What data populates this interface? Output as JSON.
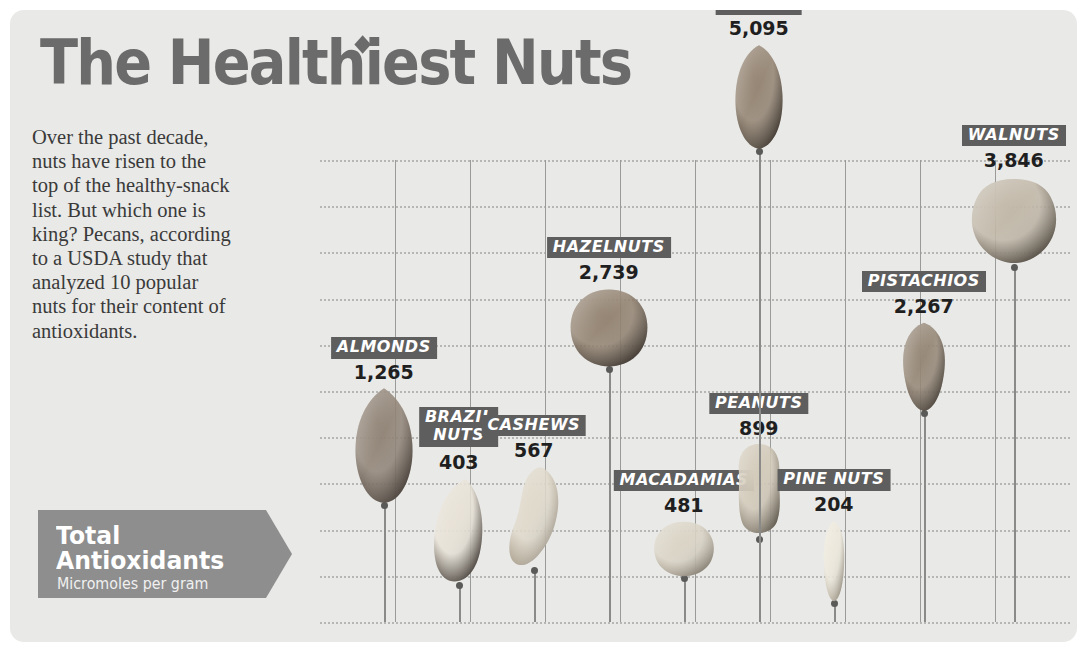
{
  "title": "The Healthiest Nuts",
  "intro": "Over the past decade, nuts have risen to the top of the healthy-snack list. But which one is king? Pecans, according to a USDA study that analyzed 10 popular nuts for their content of antioxidants.",
  "legend": {
    "line1": "Total",
    "line2": "Antioxidants",
    "sub": "Micromoles per gram"
  },
  "colors": {
    "card_bg": "#e9e9e7",
    "title": "#6b6b6b",
    "badge": "#5e5e5e",
    "banner": "#8e8e8e",
    "grid": "#b6b6b4"
  },
  "chart_data": {
    "type": "bar",
    "title": "The Healthiest Nuts",
    "xlabel": "",
    "ylabel": "Total Antioxidants (Micromoles per gram)",
    "ylim": [
      0,
      5000
    ],
    "grid": true,
    "legend": "none",
    "ytick_labels": [
      "5,000",
      "4,500",
      "4,000",
      "3,500",
      "3,000",
      "2,500",
      "2,000",
      "1,500",
      "1,000",
      "500",
      "0"
    ],
    "ytick_values": [
      5000,
      4500,
      4000,
      3500,
      3000,
      2500,
      2000,
      1500,
      1000,
      500,
      0
    ],
    "categories": [
      "ALMONDS",
      "BRAZIL NUTS",
      "CASHEWS",
      "HAZELNUTS",
      "MACADAMIAS",
      "PEANUTS",
      "PINE NUTS",
      "PISTACHIOS",
      "WALNUTS",
      "PECANS"
    ],
    "values": [
      1265,
      403,
      567,
      2739,
      481,
      899,
      204,
      2267,
      3846,
      5095
    ],
    "value_labels": [
      "1,265",
      "403",
      "567",
      "2,739",
      "481",
      "899",
      "204",
      "2,267",
      "3,846",
      "5,095"
    ],
    "points": [
      {
        "name": "ALMONDS",
        "label_lines": [
          "ALMONDS"
        ],
        "value": 1265,
        "value_label": "1,265",
        "x_frac": 0.085,
        "nut": {
          "w": 62,
          "h": 118,
          "shape": "almond",
          "c1": "#8a7c6e",
          "c2": "#4a4038"
        }
      },
      {
        "name": "BRAZIL NUTS",
        "label_lines": [
          "BRAZIL",
          "NUTS"
        ],
        "value": 403,
        "value_label": "403",
        "x_frac": 0.185,
        "nut": {
          "w": 58,
          "h": 108,
          "shape": "brazil",
          "c1": "#e6e0d4",
          "c2": "#3a322a"
        }
      },
      {
        "name": "CASHEWS",
        "label_lines": [
          "CASHEWS"
        ],
        "value": 567,
        "value_label": "567",
        "x_frac": 0.285,
        "nut": {
          "w": 60,
          "h": 105,
          "shape": "cashew",
          "c1": "#ded7c8",
          "c2": "#a79c89"
        }
      },
      {
        "name": "HAZELNUTS",
        "label_lines": [
          "HAZELNUTS"
        ],
        "value": 2739,
        "value_label": "2,739",
        "x_frac": 0.385,
        "nut": {
          "w": 80,
          "h": 82,
          "shape": "round",
          "c1": "#8c7b68",
          "c2": "#3d342b"
        }
      },
      {
        "name": "MACADAMIAS",
        "label_lines": [
          "MACADAMIAS"
        ],
        "value": 481,
        "value_label": "481",
        "x_frac": 0.485,
        "nut": {
          "w": 62,
          "h": 58,
          "shape": "round",
          "c1": "#d8d1c2",
          "c2": "#9a9080"
        }
      },
      {
        "name": "PEANUTS",
        "label_lines": [
          "PEANUTS"
        ],
        "value": 899,
        "value_label": "899",
        "x_frac": 0.585,
        "nut": {
          "w": 56,
          "h": 96,
          "shape": "peanut",
          "c1": "#cfc6b4",
          "c2": "#7d7465"
        }
      },
      {
        "name": "PINE NUTS",
        "label_lines": [
          "PINE NUTS"
        ],
        "value": 204,
        "value_label": "204",
        "x_frac": 0.685,
        "nut": {
          "w": 36,
          "h": 84,
          "shape": "pine",
          "c1": "#ece7da",
          "c2": "#b3aa97"
        }
      },
      {
        "name": "PISTACHIOS",
        "label_lines": [
          "PISTACHIOS"
        ],
        "value": 2267,
        "value_label": "2,267",
        "x_frac": 0.805,
        "nut": {
          "w": 54,
          "h": 92,
          "shape": "pistachio",
          "c1": "#8e7f6d",
          "c2": "#463d33"
        }
      },
      {
        "name": "WALNUTS",
        "label_lines": [
          "WALNUTS"
        ],
        "value": 3846,
        "value_label": "3,846",
        "x_frac": 0.925,
        "nut": {
          "w": 92,
          "h": 92,
          "shape": "walnut",
          "c1": "#bdb3a2",
          "c2": "#4e4539"
        }
      },
      {
        "name": "PECANS",
        "label_lines": [
          "PECANS"
        ],
        "value": 5095,
        "value_label": "5,095",
        "x_frac": 0.585,
        "nut": {
          "w": 62,
          "h": 108,
          "shape": "pecan",
          "c1": "#8d7c69",
          "c2": "#3f362c"
        }
      }
    ],
    "separator_count": 10
  }
}
